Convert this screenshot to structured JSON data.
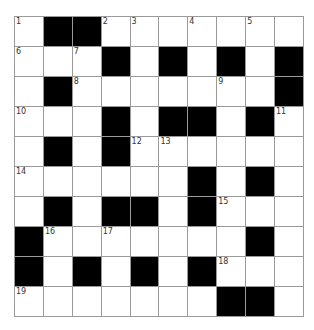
{
  "puzzle": {
    "rows": 10,
    "cols": 10,
    "colors": {
      "block": "#000000",
      "empty": "#ffffff",
      "border": "#9a9a9a",
      "number": "#333333"
    },
    "grid": [
      [
        {
          "n": "1"
        },
        {
          "b": 1
        },
        {
          "b": 1
        },
        {
          "n": "2"
        },
        {
          "n": "3"
        },
        {},
        {
          "n": "4"
        },
        {},
        {
          "n": "5"
        },
        {}
      ],
      [
        {
          "n": "6"
        },
        {},
        {
          "n": "7"
        },
        {
          "b": 1
        },
        {},
        {
          "b": 1
        },
        {},
        {
          "b": 1
        },
        {},
        {
          "b": 1
        }
      ],
      [
        {},
        {
          "b": 1
        },
        {
          "n": "8"
        },
        {},
        {},
        {},
        {},
        {
          "n": "9"
        },
        {},
        {
          "b": 1
        }
      ],
      [
        {
          "n": "10"
        },
        {},
        {},
        {
          "b": 1
        },
        {},
        {
          "b": 1
        },
        {
          "b": 1
        },
        {},
        {
          "b": 1
        },
        {
          "n": "11"
        }
      ],
      [
        {},
        {
          "b": 1
        },
        {},
        {
          "b": 1
        },
        {
          "n": "12"
        },
        {
          "n": "13"
        },
        {},
        {},
        {},
        {}
      ],
      [
        {
          "n": "14"
        },
        {},
        {},
        {},
        {},
        {},
        {
          "b": 1
        },
        {},
        {
          "b": 1
        },
        {}
      ],
      [
        {},
        {
          "b": 1
        },
        {},
        {
          "b": 1
        },
        {
          "b": 1
        },
        {},
        {
          "b": 1
        },
        {
          "n": "15"
        },
        {},
        {}
      ],
      [
        {
          "b": 1
        },
        {
          "n": "16"
        },
        {},
        {
          "n": "17"
        },
        {},
        {},
        {},
        {},
        {
          "b": 1
        },
        {}
      ],
      [
        {
          "b": 1
        },
        {},
        {
          "b": 1
        },
        {},
        {
          "b": 1
        },
        {},
        {
          "b": 1
        },
        {
          "n": "18"
        },
        {},
        {}
      ],
      [
        {
          "n": "19"
        },
        {},
        {},
        {},
        {},
        {},
        {},
        {
          "b": 1
        },
        {
          "b": 1
        },
        {}
      ]
    ]
  }
}
